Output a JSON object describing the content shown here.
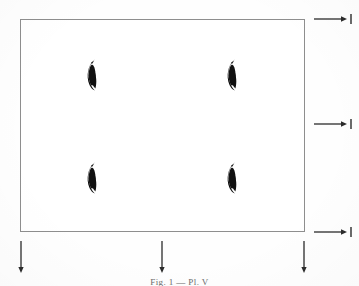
{
  "figure": {
    "caption": "Fig. 1 — Pl. V",
    "background_color": "#ffffff",
    "ink_color": "#111111",
    "rule_color": "#8e8e8e",
    "boundary": {
      "label": "domain-rectangle",
      "x": 20,
      "y": 19,
      "width": 285,
      "height": 213
    },
    "inclusions": [
      {
        "label": "leaf-1",
        "x": 92,
        "y": 75,
        "width": 13,
        "height": 34
      },
      {
        "label": "leaf-2",
        "x": 232,
        "y": 75,
        "width": 13,
        "height": 34
      },
      {
        "label": "leaf-3",
        "x": 92,
        "y": 178,
        "width": 13,
        "height": 34
      },
      {
        "label": "leaf-4",
        "x": 232,
        "y": 178,
        "width": 13,
        "height": 34
      }
    ],
    "right_arrows": [
      {
        "label": "right-arrow-top",
        "x": 313,
        "y": 19,
        "direction": "right"
      },
      {
        "label": "right-arrow-middle",
        "x": 313,
        "y": 124,
        "direction": "right"
      },
      {
        "label": "right-arrow-bottom",
        "x": 313,
        "y": 232,
        "direction": "right"
      }
    ],
    "bottom_arrows": [
      {
        "label": "down-arrow-left",
        "x": 21,
        "y": 240,
        "direction": "down"
      },
      {
        "label": "down-arrow-center",
        "x": 162,
        "y": 240,
        "direction": "down"
      },
      {
        "label": "down-arrow-right",
        "x": 304,
        "y": 240,
        "direction": "down"
      }
    ]
  }
}
